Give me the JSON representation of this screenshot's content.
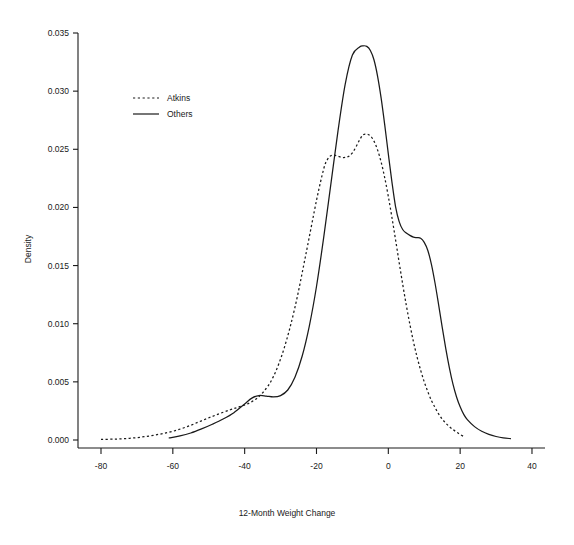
{
  "chart_data": {
    "type": "line",
    "title": "",
    "subtitle": "",
    "xlabel": "12-Month Weight Change",
    "ylabel": "Density",
    "xlim": [
      -88,
      46
    ],
    "ylim": [
      0.0,
      0.0358
    ],
    "xticks": [
      -80,
      -60,
      -40,
      -20,
      0,
      20,
      40
    ],
    "xtick_labels": [
      "-80",
      "-60",
      "-40",
      "-20",
      "0",
      "20",
      "40"
    ],
    "yticks": [
      0.0,
      0.005,
      0.01,
      0.015,
      0.02,
      0.025,
      0.03,
      0.035
    ],
    "ytick_labels": [
      "0.000",
      "0.005",
      "0.010",
      "0.015",
      "0.020",
      "0.025",
      "0.030",
      "0.035"
    ],
    "grid": false,
    "legend_position": "upper-left",
    "legend": [
      {
        "name": "Atkins",
        "style": "dashed"
      },
      {
        "name": "Others",
        "style": "solid"
      }
    ],
    "series": [
      {
        "name": "Atkins",
        "style": "dashed",
        "x": [
          -80,
          -76,
          -72,
          -68,
          -64,
          -60,
          -56,
          -52,
          -48,
          -44,
          -41,
          -38,
          -35,
          -32,
          -29,
          -26,
          -23,
          -20,
          -18,
          -17,
          -16,
          -15,
          -14,
          -13,
          -12,
          -11,
          -10,
          -9,
          -8,
          -7,
          -6,
          -5,
          -4,
          -3,
          -2,
          -1,
          0,
          1,
          2,
          3,
          4,
          5,
          6,
          7,
          8,
          9,
          10,
          11,
          12,
          13,
          14,
          15,
          16,
          17,
          18,
          19,
          20,
          21
        ],
        "y": [
          5e-05,
          8e-05,
          0.00015,
          0.00028,
          0.00048,
          0.00075,
          0.00115,
          0.00165,
          0.00215,
          0.0026,
          0.0029,
          0.0033,
          0.00405,
          0.00545,
          0.0079,
          0.0114,
          0.0159,
          0.0206,
          0.0233,
          0.0241,
          0.02445,
          0.0245,
          0.0244,
          0.0243,
          0.0243,
          0.0244,
          0.0247,
          0.0252,
          0.0258,
          0.02625,
          0.0263,
          0.02615,
          0.0257,
          0.02495,
          0.0239,
          0.02255,
          0.02095,
          0.01915,
          0.01725,
          0.0153,
          0.0134,
          0.0116,
          0.00995,
          0.00845,
          0.00715,
          0.006,
          0.005,
          0.00415,
          0.0034,
          0.0028,
          0.00225,
          0.0018,
          0.00145,
          0.00115,
          0.0009,
          0.00068,
          0.00048,
          0.0003
        ]
      },
      {
        "name": "Others",
        "style": "solid",
        "x": [
          -61,
          -58,
          -55,
          -52,
          -49,
          -46,
          -43,
          -40,
          -38,
          -36,
          -34,
          -32,
          -30,
          -28,
          -26,
          -24,
          -22,
          -20,
          -18,
          -16,
          -14,
          -12,
          -10,
          -8,
          -7,
          -6,
          -5,
          -4,
          -3,
          -2,
          -1,
          0,
          1,
          2,
          3,
          4,
          5,
          6,
          7,
          8,
          9,
          10,
          11,
          12,
          13,
          14,
          15,
          16,
          17,
          18,
          19,
          20,
          21,
          22,
          24,
          26,
          28,
          30,
          32,
          34
        ],
        "y": [
          0.00018,
          0.00035,
          0.0006,
          0.00095,
          0.00135,
          0.0018,
          0.00235,
          0.0031,
          0.0036,
          0.00382,
          0.00378,
          0.0037,
          0.00382,
          0.0043,
          0.0054,
          0.0072,
          0.0098,
          0.0132,
          0.0174,
          0.022,
          0.0266,
          0.0306,
          0.0331,
          0.0338,
          0.0339,
          0.03385,
          0.0335,
          0.0327,
          0.0313,
          0.0294,
          0.0271,
          0.0246,
          0.0222,
          0.0201,
          0.0188,
          0.0181,
          0.0178,
          0.0176,
          0.01745,
          0.0174,
          0.01735,
          0.017,
          0.0163,
          0.0151,
          0.0135,
          0.01165,
          0.0097,
          0.00785,
          0.0062,
          0.0048,
          0.0037,
          0.00285,
          0.0022,
          0.00175,
          0.00115,
          0.00075,
          0.00048,
          0.0003,
          0.00018,
          0.00012
        ]
      }
    ]
  }
}
